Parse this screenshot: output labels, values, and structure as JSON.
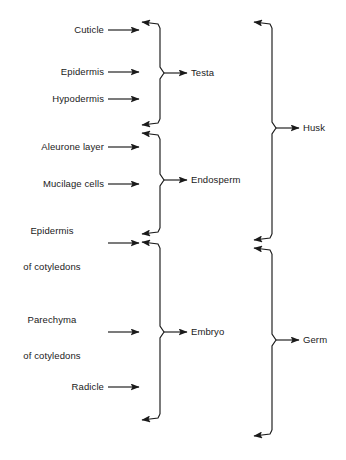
{
  "diagram": {
    "type": "bracket-grouping-diagram",
    "stroke_color": "#1a1a1a",
    "text_color": "#1a1a1a",
    "background_color": "#ffffff",
    "tissue_labels": [
      {
        "id": "cuticle",
        "text": "Cuticle",
        "lines": [
          "Cuticle"
        ]
      },
      {
        "id": "epidermis",
        "text": "Epidermis",
        "lines": [
          "Epidermis"
        ]
      },
      {
        "id": "hypodermis",
        "text": "Hypodermis",
        "lines": [
          "Hypodermis"
        ]
      },
      {
        "id": "aleurone-layer",
        "text": "Aleurone layer",
        "lines": [
          "Aleurone layer"
        ]
      },
      {
        "id": "mucilage-cells",
        "text": "Mucilage cells",
        "lines": [
          "Mucilage cells"
        ]
      },
      {
        "id": "epidermis-of-cotyledons",
        "text": "Epidermis of cotyledons",
        "lines": [
          "Epidermis",
          "of cotyledons"
        ]
      },
      {
        "id": "parechyma-of-cotyledons",
        "text": "Parechyma of cotyledons",
        "lines": [
          "Parechyma",
          "of cotyledons"
        ]
      },
      {
        "id": "radicle",
        "text": "Radicle",
        "lines": [
          "Radicle"
        ]
      }
    ],
    "group_labels_inner": [
      {
        "id": "testa",
        "text": "Testa",
        "members": [
          "Cuticle",
          "Epidermis",
          "Hypodermis"
        ]
      },
      {
        "id": "endosperm",
        "text": "Endosperm",
        "members": [
          "Aleurone layer",
          "Mucilage cells"
        ]
      },
      {
        "id": "embryo",
        "text": "Embryo",
        "members": [
          "Epidermis of cotyledons",
          "Parechyma of cotyledons",
          "Radicle"
        ]
      }
    ],
    "group_labels_outer": [
      {
        "id": "husk",
        "text": "Husk",
        "members": [
          "Testa",
          "Endosperm"
        ]
      },
      {
        "id": "germ",
        "text": "Germ",
        "members": [
          "Embryo"
        ]
      }
    ]
  }
}
